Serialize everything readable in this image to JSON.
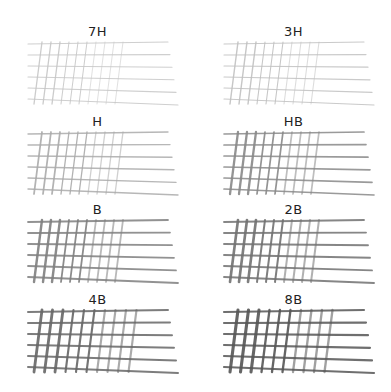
{
  "swatches": [
    {
      "grade": "7H",
      "darkness": 0.18
    },
    {
      "grade": "3H",
      "darkness": 0.22
    },
    {
      "grade": "H",
      "darkness": 0.35
    },
    {
      "grade": "HB",
      "darkness": 0.55
    },
    {
      "grade": "B",
      "darkness": 0.6
    },
    {
      "grade": "2B",
      "darkness": 0.68
    },
    {
      "grade": "4B",
      "darkness": 0.75
    },
    {
      "grade": "8B",
      "darkness": 0.85
    }
  ]
}
